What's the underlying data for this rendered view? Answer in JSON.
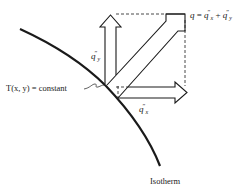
{
  "diagram": {
    "title_equation": {
      "lhs": "q",
      "eq": " = ",
      "term1_base": "q",
      "term1_sup": "″",
      "term1_sub": "x",
      "plus": " + ",
      "term2_base": "q",
      "term2_sup": "″",
      "term2_sub": "y"
    },
    "qy_label": {
      "base": "q",
      "sup": "″",
      "sub": "y"
    },
    "qx_label": {
      "base": "q",
      "sup": "″",
      "sub": "x"
    },
    "isotherm_equation": "T(x, y) = constant",
    "isotherm_label": "Isotherm",
    "colors": {
      "stroke": "#1a1a1a",
      "background": "#ffffff"
    },
    "elements": {
      "curve": "isotherm curve",
      "arrows": [
        "q_y vertical heat flux",
        "q_x horizontal heat flux",
        "q resultant heat flux"
      ],
      "guides": "dashed projection lines"
    }
  }
}
